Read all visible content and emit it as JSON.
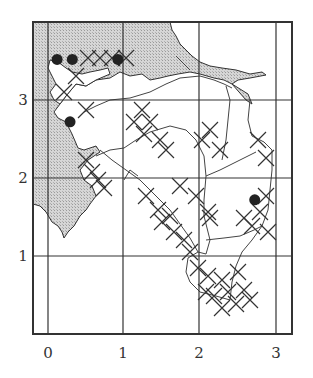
{
  "figure": {
    "type": "distribution-grid-map",
    "x_ticks": [
      "0",
      "1",
      "2",
      "3"
    ],
    "y_ticks": [
      "1",
      "2",
      "3"
    ],
    "colors": {
      "land_shade": "#c8c8c8",
      "lines": "#333333",
      "background": "#ffffff",
      "marker": "#222222"
    }
  },
  "legend_symbols": {
    "dot": "filled-circle-record",
    "cross": "x-mark-record",
    "shaded": "shaded-area"
  },
  "markers": {
    "dots": [
      {
        "x": 0.12,
        "y": 3.52
      },
      {
        "x": 0.32,
        "y": 3.52
      },
      {
        "x": 0.92,
        "y": 3.52
      },
      {
        "x": 0.29,
        "y": 2.72
      },
      {
        "x": 2.72,
        "y": 1.72
      }
    ]
  }
}
